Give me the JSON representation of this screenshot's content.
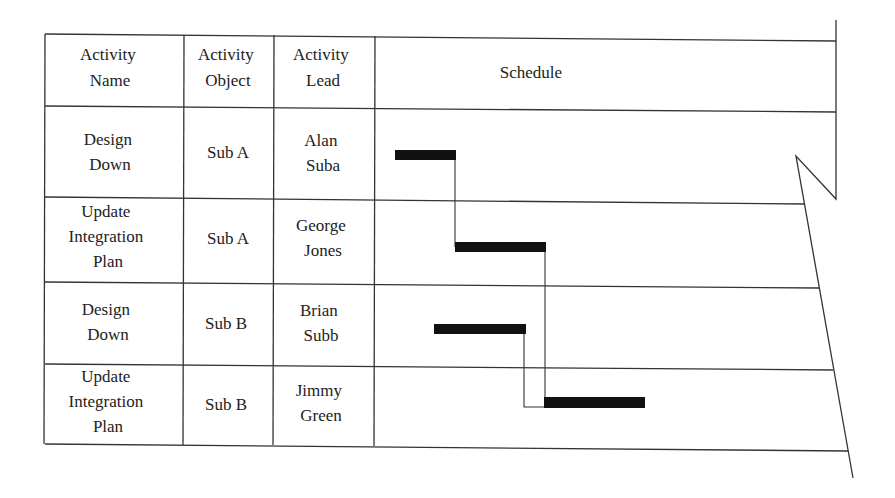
{
  "table": {
    "headers": [
      "Activity\nName",
      "Activity\nObject",
      "Activity\nLead",
      "Schedule"
    ],
    "header_lines": [
      [
        "Activity",
        "Name"
      ],
      [
        "Activity",
        "Object"
      ],
      [
        "Activity",
        "Lead"
      ],
      [
        "Schedule"
      ]
    ],
    "rows": [
      {
        "name": [
          "Design",
          "Down"
        ],
        "object": "Sub A",
        "lead": [
          "Alan",
          "Suba"
        ]
      },
      {
        "name": [
          "Update",
          "Integration",
          "Plan"
        ],
        "object": "Sub A",
        "lead": [
          "George",
          "Jones"
        ]
      },
      {
        "name": [
          "Design",
          "Down"
        ],
        "object": "Sub B",
        "lead": [
          "Brian",
          "Subb"
        ]
      },
      {
        "name": [
          "Update",
          "Integration",
          "Plan"
        ],
        "object": "Sub B",
        "lead": [
          "Jimmy",
          "Green"
        ]
      }
    ]
  },
  "schedule": {
    "bars": [
      {
        "row": 0,
        "start_px": 395,
        "end_px": 455
      },
      {
        "row": 1,
        "start_px": 455,
        "end_px": 545
      },
      {
        "row": 2,
        "start_px": 434,
        "end_px": 525
      },
      {
        "row": 3,
        "start_px": 544,
        "end_px": 645
      }
    ],
    "dependencies": [
      {
        "from": 0,
        "to": 1
      },
      {
        "from": 1,
        "to": 3
      },
      {
        "from": 2,
        "to": 3
      }
    ]
  },
  "colors": {
    "line": "#333333",
    "bar": "#111111",
    "background": "#ffffff"
  }
}
